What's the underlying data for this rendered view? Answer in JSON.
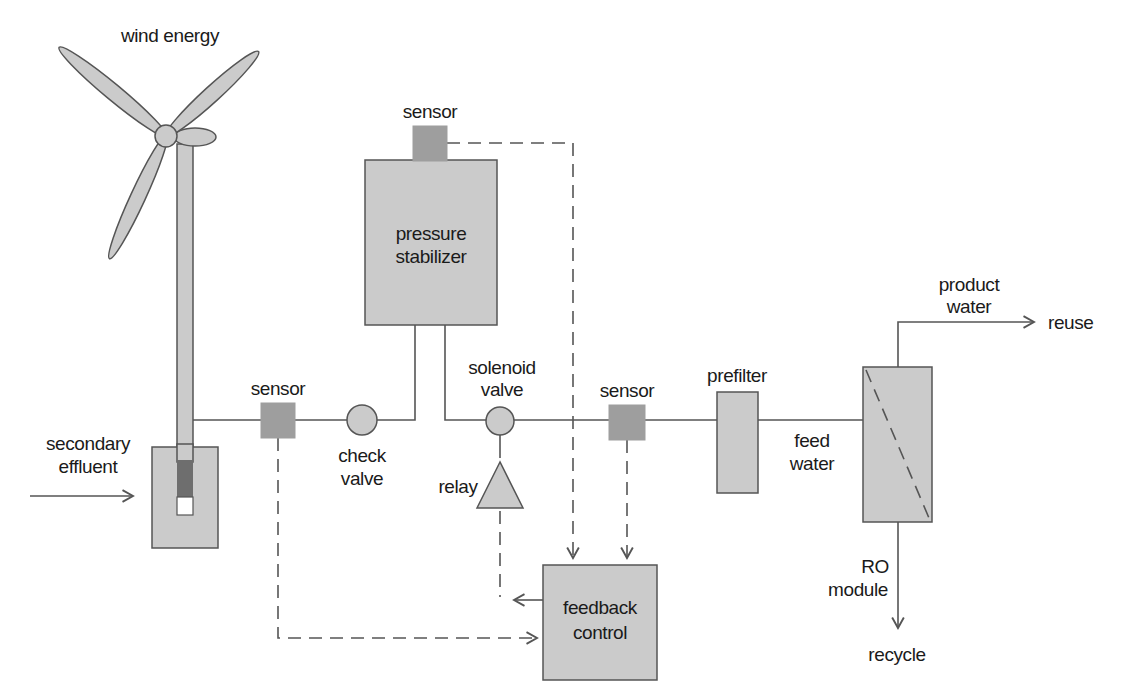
{
  "diagram": {
    "title_context": "wind-powered reverse osmosis water treatment schematic",
    "labels": {
      "wind_energy": "wind energy",
      "secondary_effluent_line1": "secondary",
      "secondary_effluent_line2": "effluent",
      "sensor_well": "sensor",
      "check_valve_line1": "check",
      "check_valve_line2": "valve",
      "pressure_stabilizer_line1": "pressure",
      "pressure_stabilizer_line2": "stabilizer",
      "sensor_top": "sensor",
      "solenoid_valve_line1": "solenoid",
      "solenoid_valve_line2": "valve",
      "relay": "relay",
      "sensor_feed": "sensor",
      "prefilter": "prefilter",
      "feed_water_line1": "feed",
      "feed_water_line2": "water",
      "product_water_line1": "product",
      "product_water_line2": "water",
      "reuse": "reuse",
      "ro_module_line1": "RO",
      "ro_module_line2": "module",
      "recycle": "recycle",
      "feedback_control_line1": "feedback",
      "feedback_control_line2": "control"
    },
    "colors": {
      "component_fill": "#cbcbcb",
      "sensor_fill": "#9e9e9e",
      "pump_fill": "#6e6e6e",
      "line": "#555555",
      "text": "#1a1a1a",
      "background": "#ffffff"
    }
  }
}
